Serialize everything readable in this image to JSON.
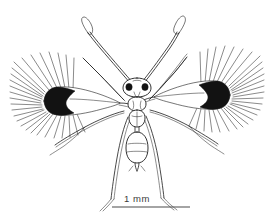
{
  "figure": {
    "background_color": "#ffffff",
    "ink_color": "#1b1b1b",
    "caption_color": "#3b3b3b",
    "width": 274,
    "height": 222
  },
  "scale_bar": {
    "label": "1 mm",
    "x_start": 112,
    "x_end": 190,
    "y": 207,
    "color": "#4a4a4a"
  },
  "anatomy": {
    "head_label": "head",
    "eye_left_label": "left-compound-eye",
    "eye_right_label": "right-compound-eye",
    "thorax_label": "mesosoma",
    "abdomen_label": "metasoma",
    "antenna_left_label": "left-antenna",
    "antenna_right_label": "right-antenna",
    "wing_left_label": "left-forewing",
    "wing_right_label": "right-forewing",
    "foreleg_left_label": "left-foreleg",
    "foreleg_right_label": "right-foreleg",
    "midleg_left_label": "left-midleg",
    "midleg_right_label": "right-midleg",
    "hindleg_left_label": "left-hindleg",
    "hindleg_right_label": "right-hindleg"
  }
}
